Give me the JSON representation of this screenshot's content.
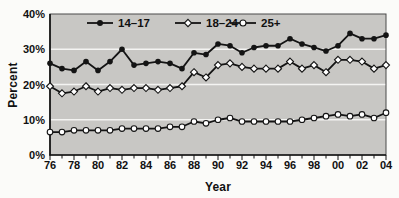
{
  "chart_data": {
    "type": "line",
    "title": "",
    "xlabel": "Year",
    "ylabel": "Percent",
    "ylim": [
      0,
      40
    ],
    "y_ticks": [
      0,
      10,
      20,
      30,
      40
    ],
    "y_tick_labels": [
      "0%",
      "10%",
      "20%",
      "30%",
      "40%"
    ],
    "gridline_values": [
      10,
      20,
      30
    ],
    "gridline_color": "#f4f4f2",
    "plot_bg_color": "#c8c7c4",
    "line_color": "#141414",
    "legend_position": "top-left-inside",
    "x_years": [
      1976,
      1977,
      1978,
      1979,
      1980,
      1981,
      1982,
      1983,
      1984,
      1985,
      1986,
      1987,
      1988,
      1989,
      1990,
      1991,
      1992,
      1993,
      1994,
      1995,
      1996,
      1997,
      1998,
      1999,
      2000,
      2001,
      2002,
      2003,
      2004
    ],
    "x_tick_labels": [
      "76",
      "78",
      "80",
      "82",
      "84",
      "86",
      "88",
      "90",
      "92",
      "94",
      "96",
      "98",
      "00",
      "02",
      "04"
    ],
    "series": [
      {
        "id": "14-17",
        "name": "14–17",
        "marker": "filled-circle",
        "color": "#141414",
        "marker_fill": "#141414",
        "values": [
          26,
          24.5,
          24,
          26.5,
          24,
          26.5,
          30,
          25.5,
          26,
          26.5,
          26,
          24.5,
          29,
          28.5,
          31.5,
          31,
          29,
          30.5,
          31,
          31,
          33,
          31.5,
          30.5,
          29.5,
          31,
          34.5,
          33,
          33,
          34
        ]
      },
      {
        "id": "18-24",
        "name": "18–24",
        "marker": "open-diamond",
        "color": "#141414",
        "marker_fill": "#ffffff",
        "values": [
          19.5,
          17.5,
          18,
          19.5,
          18,
          19,
          18.5,
          19,
          19,
          18.5,
          19,
          19.5,
          23.5,
          22,
          25.5,
          26,
          25,
          24.5,
          24.5,
          24.5,
          26.5,
          24.5,
          25.5,
          23.5,
          27,
          27,
          26.5,
          24.5,
          25.5
        ]
      },
      {
        "id": "25plus",
        "name": "25+",
        "marker": "open-circle",
        "color": "#141414",
        "marker_fill": "#ffffff",
        "values": [
          6.5,
          6.5,
          7,
          7,
          7,
          7,
          7.5,
          7.5,
          7.5,
          7.5,
          8,
          8,
          9.5,
          9,
          10,
          10.5,
          9.5,
          9.5,
          9.5,
          9.5,
          9.5,
          10,
          10.5,
          11,
          11.5,
          11,
          11.5,
          10.5,
          12
        ]
      }
    ]
  }
}
